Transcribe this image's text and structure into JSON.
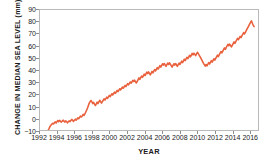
{
  "chart_data": {
    "type": "line",
    "title": "",
    "xlabel": "YEAR",
    "ylabel": "CHANGE IN MEDIAN  SEA LEVEL (mm)",
    "xlim": [
      1992,
      2017
    ],
    "ylim": [
      -10,
      90
    ],
    "xticks": [
      1992,
      1994,
      1996,
      1998,
      2000,
      2002,
      2004,
      2006,
      2008,
      2010,
      2012,
      2014,
      2016
    ],
    "yticks": [
      -10,
      0,
      10,
      20,
      30,
      40,
      50,
      60,
      70,
      80,
      90
    ],
    "grid": false,
    "legend": false,
    "line_color": "#E8603C",
    "line_width": 1.6,
    "series": [
      {
        "name": "Change in median sea level",
        "x": [
          1992.95,
          1993.05,
          1993.15,
          1993.25,
          1993.35,
          1993.45,
          1993.55,
          1993.65,
          1993.75,
          1993.85,
          1993.95,
          1994.05,
          1994.15,
          1994.25,
          1994.35,
          1994.45,
          1994.55,
          1994.65,
          1994.75,
          1994.85,
          1994.95,
          1995.05,
          1995.15,
          1995.25,
          1995.35,
          1995.45,
          1995.55,
          1995.65,
          1995.75,
          1995.85,
          1995.95,
          1996.05,
          1996.15,
          1996.25,
          1996.35,
          1996.45,
          1996.55,
          1996.65,
          1996.75,
          1996.85,
          1996.95,
          1997.05,
          1997.15,
          1997.25,
          1997.35,
          1997.45,
          1997.55,
          1997.65,
          1997.75,
          1997.85,
          1997.95,
          1998.05,
          1998.15,
          1998.25,
          1998.35,
          1998.45,
          1998.55,
          1998.65,
          1998.75,
          1998.85,
          1998.95,
          1999.05,
          1999.15,
          1999.25,
          1999.35,
          1999.45,
          1999.55,
          1999.65,
          1999.75,
          1999.85,
          1999.95,
          2000.05,
          2000.15,
          2000.25,
          2000.35,
          2000.45,
          2000.55,
          2000.65,
          2000.75,
          2000.85,
          2000.95,
          2001.05,
          2001.15,
          2001.25,
          2001.35,
          2001.45,
          2001.55,
          2001.65,
          2001.75,
          2001.85,
          2001.95,
          2002.05,
          2002.15,
          2002.25,
          2002.35,
          2002.45,
          2002.55,
          2002.65,
          2002.75,
          2002.85,
          2002.95,
          2003.05,
          2003.15,
          2003.25,
          2003.35,
          2003.45,
          2003.55,
          2003.65,
          2003.75,
          2003.85,
          2003.95,
          2004.05,
          2004.15,
          2004.25,
          2004.35,
          2004.45,
          2004.55,
          2004.65,
          2004.75,
          2004.85,
          2004.95,
          2005.05,
          2005.15,
          2005.25,
          2005.35,
          2005.45,
          2005.55,
          2005.65,
          2005.75,
          2005.85,
          2005.95,
          2006.05,
          2006.15,
          2006.25,
          2006.35,
          2006.45,
          2006.55,
          2006.65,
          2006.75,
          2006.85,
          2006.95,
          2007.05,
          2007.15,
          2007.25,
          2007.35,
          2007.45,
          2007.55,
          2007.65,
          2007.75,
          2007.85,
          2007.95,
          2008.05,
          2008.15,
          2008.25,
          2008.35,
          2008.45,
          2008.55,
          2008.65,
          2008.75,
          2008.85,
          2008.95,
          2009.05,
          2009.15,
          2009.25,
          2009.35,
          2009.45,
          2009.55,
          2009.65,
          2009.75,
          2009.85,
          2009.95,
          2010.05,
          2010.15,
          2010.25,
          2010.35,
          2010.45,
          2010.55,
          2010.65,
          2010.75,
          2010.85,
          2010.95,
          2011.05,
          2011.15,
          2011.25,
          2011.35,
          2011.45,
          2011.55,
          2011.65,
          2011.75,
          2011.85,
          2011.95,
          2012.05,
          2012.15,
          2012.25,
          2012.35,
          2012.45,
          2012.55,
          2012.65,
          2012.75,
          2012.85,
          2012.95,
          2013.05,
          2013.15,
          2013.25,
          2013.35,
          2013.45,
          2013.55,
          2013.65,
          2013.75,
          2013.85,
          2013.95,
          2014.05,
          2014.15,
          2014.25,
          2014.35,
          2014.45,
          2014.55,
          2014.65,
          2014.75,
          2014.85,
          2014.95,
          2015.05,
          2015.15,
          2015.25,
          2015.35,
          2015.45,
          2015.55,
          2015.65,
          2015.75,
          2015.85,
          2015.95,
          2016.05,
          2016.15,
          2016.25,
          2016.35,
          2016.45,
          2016.55
        ],
        "y": [
          -10.0,
          -8.6,
          -7.0,
          -6.0,
          -5.2,
          -4.4,
          -5.0,
          -4.0,
          -3.2,
          -4.2,
          -3.0,
          -2.2,
          -3.0,
          -2.0,
          -2.8,
          -3.4,
          -2.6,
          -1.8,
          -2.6,
          -3.4,
          -2.4,
          -3.2,
          -4.0,
          -3.2,
          -2.4,
          -3.0,
          -2.0,
          -1.2,
          -2.0,
          -2.8,
          -1.8,
          -1.0,
          -1.8,
          -0.8,
          0.2,
          -0.6,
          0.6,
          1.6,
          0.8,
          1.8,
          3.0,
          2.2,
          3.4,
          5.0,
          6.6,
          8.4,
          10.4,
          12.4,
          13.6,
          14.6,
          13.4,
          12.0,
          13.0,
          11.6,
          10.4,
          11.8,
          13.2,
          12.0,
          13.4,
          14.8,
          13.6,
          12.4,
          13.6,
          14.8,
          16.0,
          15.0,
          16.2,
          17.4,
          16.4,
          17.6,
          18.8,
          17.8,
          19.0,
          20.2,
          19.2,
          20.4,
          21.6,
          20.6,
          21.8,
          23.0,
          22.0,
          23.2,
          24.4,
          23.4,
          24.6,
          25.8,
          24.8,
          26.0,
          27.2,
          26.2,
          27.4,
          28.6,
          27.6,
          28.8,
          30.0,
          29.0,
          30.2,
          31.4,
          30.4,
          31.6,
          30.2,
          29.2,
          30.6,
          32.0,
          33.4,
          32.2,
          33.6,
          35.0,
          33.8,
          35.2,
          36.6,
          35.4,
          36.8,
          38.2,
          37.0,
          38.4,
          37.2,
          36.0,
          37.4,
          38.8,
          37.6,
          39.0,
          40.4,
          39.2,
          40.6,
          42.0,
          40.8,
          42.2,
          43.6,
          42.4,
          43.8,
          45.2,
          44.0,
          45.4,
          44.2,
          43.0,
          44.4,
          45.8,
          44.6,
          46.0,
          44.8,
          43.6,
          42.4,
          43.8,
          45.2,
          44.0,
          45.4,
          44.2,
          43.0,
          44.4,
          45.8,
          44.6,
          46.0,
          47.4,
          46.2,
          47.6,
          49.0,
          47.8,
          49.2,
          50.6,
          49.4,
          50.8,
          52.2,
          51.0,
          52.4,
          53.8,
          52.6,
          54.0,
          53.0,
          52.0,
          53.4,
          54.8,
          53.6,
          52.4,
          51.2,
          49.8,
          48.4,
          47.0,
          45.6,
          44.4,
          43.2,
          44.6,
          43.4,
          44.8,
          46.2,
          45.0,
          46.4,
          47.8,
          46.6,
          48.0,
          49.4,
          48.2,
          49.6,
          51.0,
          52.4,
          51.2,
          52.6,
          54.0,
          55.4,
          54.2,
          55.6,
          57.0,
          58.4,
          57.2,
          58.6,
          60.0,
          61.4,
          60.2,
          61.6,
          60.4,
          59.2,
          60.6,
          62.0,
          63.4,
          62.2,
          63.6,
          65.0,
          66.4,
          65.2,
          66.6,
          68.0,
          67.0,
          68.4,
          69.8,
          71.2,
          70.0,
          71.4,
          72.8,
          74.2,
          75.6,
          77.0,
          78.4,
          79.8,
          81.0,
          79.0,
          77.4,
          76.2
        ]
      }
    ]
  }
}
